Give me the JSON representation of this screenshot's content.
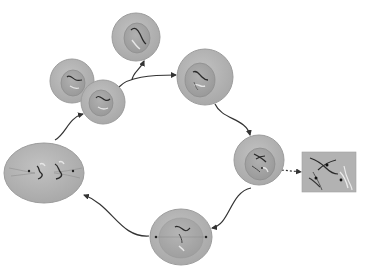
{
  "diagram": {
    "type": "cell-cycle",
    "colors": {
      "background": "#ffffff",
      "cytoplasm": "#b4b4b4",
      "cytoplasm_edge": "#9c9c9c",
      "nucleus": "#a5a5a5",
      "nucleus_edge": "#8e8e8e",
      "chromosome_dark": "#2a2a2a",
      "chromosome_light": "#e6e6e6",
      "arrow": "#333333",
      "inset_bg": "#b2b2b2"
    },
    "stages": [
      {
        "id": "daughter-cell-released",
        "shape": "circle",
        "cx": 136,
        "cy": 37,
        "r": 24
      },
      {
        "id": "interphase-cell",
        "shape": "circle",
        "cx": 205,
        "cy": 77,
        "r": 28
      },
      {
        "id": "prophase-cell",
        "shape": "circle",
        "cx": 259,
        "cy": 160,
        "r": 25
      },
      {
        "id": "metaphase-cell",
        "shape": "ellipse",
        "cx": 181,
        "cy": 237,
        "rx": 31,
        "ry": 28
      },
      {
        "id": "anaphase-cell",
        "shape": "ellipse",
        "cx": 44,
        "cy": 173,
        "rx": 40,
        "ry": 30
      },
      {
        "id": "daughter-cell-a",
        "shape": "circle",
        "cx": 72,
        "cy": 81,
        "r": 22
      },
      {
        "id": "daughter-cell-b",
        "shape": "circle",
        "cx": 103,
        "cy": 102,
        "r": 22
      }
    ],
    "inset": {
      "id": "chromosome-detail-inset",
      "x": 302,
      "y": 152,
      "width": 54,
      "height": 40
    },
    "arrows": [
      {
        "from": "daughter-cells",
        "to": "interphase-cell"
      },
      {
        "from": "daughter-cells",
        "to": "daughter-cell-released"
      },
      {
        "from": "interphase-cell",
        "to": "prophase-cell"
      },
      {
        "from": "prophase-cell",
        "to": "chromosome-detail-inset",
        "style": "dashed"
      },
      {
        "from": "prophase-cell",
        "to": "metaphase-cell"
      },
      {
        "from": "metaphase-cell",
        "to": "anaphase-cell"
      },
      {
        "from": "anaphase-cell",
        "to": "daughter-cells"
      }
    ]
  }
}
